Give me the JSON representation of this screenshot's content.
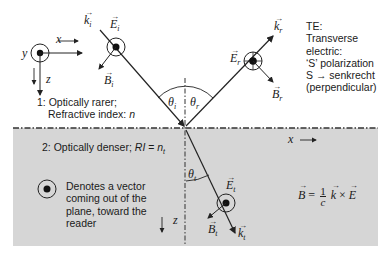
{
  "diagram": {
    "type": "TE wave reflection and refraction at an interface",
    "colors": {
      "medium2_fill": "#d6d6d6",
      "line": "#222222",
      "background": "#ffffff"
    },
    "axes": {
      "x_label": "x",
      "y_label": "y",
      "z_label": "z"
    },
    "medium1": {
      "line1": "1: Optically rarer;",
      "line2_prefix": "Refractive index: ",
      "line2_symbol": "n"
    },
    "medium2": {
      "prefix": "2: Optically denser; ",
      "ri": "RI",
      "eq": " = ",
      "symbol": "n",
      "symbol_sub": "t"
    },
    "incident": {
      "k": "k",
      "k_sub": "i",
      "E": "E",
      "E_sub": "i",
      "B": "B",
      "B_sub": "i",
      "theta": "θ",
      "theta_sub": "i"
    },
    "reflected": {
      "k": "k",
      "k_sub": "r",
      "E": "E",
      "E_sub": "r",
      "B": "B",
      "B_sub": "r",
      "theta": "θ",
      "theta_sub": "r"
    },
    "transmitted": {
      "k": "k",
      "k_sub": "t",
      "E": "E",
      "E_sub": "t",
      "B": "B",
      "B_sub": "t",
      "theta": "θ",
      "theta_sub": "t"
    },
    "te_box": {
      "lines": [
        "TE:",
        "Transverse",
        "electric:",
        "‘S’ polarization",
        "S → senkrecht",
        "(perpendicular)"
      ]
    },
    "legend_note": {
      "lines": [
        "Denotes a vector",
        "coming out of the",
        "plane, toward the",
        "reader"
      ]
    },
    "equation": {
      "lhs": "B",
      "equals": "=",
      "num": "1",
      "den": "c",
      "k": "k",
      "times": "×",
      "E": "E"
    },
    "x_axis_lower_label": "x",
    "z_axis_lower_label": "z"
  }
}
